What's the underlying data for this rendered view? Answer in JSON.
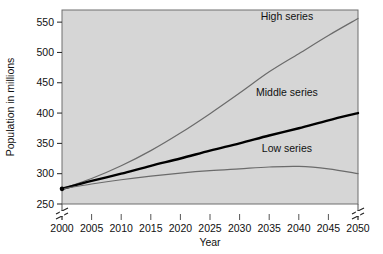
{
  "chart_data": {
    "type": "line",
    "title": "",
    "xlabel": "Year",
    "ylabel": "Population in millions",
    "xlim": [
      2000,
      2050
    ],
    "ylim": [
      250,
      570
    ],
    "xticks": [
      2000,
      2005,
      2010,
      2015,
      2020,
      2025,
      2030,
      2035,
      2040,
      2045,
      2050
    ],
    "yticks": [
      250,
      300,
      350,
      400,
      450,
      500,
      550
    ],
    "xtick_labels": [
      "2000",
      "2005",
      "2010",
      "2015",
      "2020",
      "2025",
      "2030",
      "2035",
      "2040",
      "2045",
      "2050"
    ],
    "ytick_labels": [
      "250",
      "300",
      "350",
      "400",
      "450",
      "500",
      "550"
    ],
    "grid": false,
    "legend": "inline-annotations",
    "axis_break": {
      "present": true,
      "position": "below-lowest-ytick",
      "sides": [
        "left",
        "right"
      ]
    },
    "plot_background_color": "#d6d6d6",
    "plot_border_color": "#6e6e6e",
    "x": [
      2000,
      2005,
      2010,
      2015,
      2020,
      2025,
      2030,
      2035,
      2040,
      2045,
      2050
    ],
    "series": [
      {
        "name": "High series",
        "label": "High series",
        "color": "#6b6b6b",
        "line_width": 1.2,
        "values": [
          275,
          292,
          313,
          338,
          367,
          399,
          433,
          468,
          498,
          528,
          556
        ]
      },
      {
        "name": "Middle series",
        "label": "Middle series",
        "color": "#000000",
        "line_width": 2.4,
        "values": [
          275,
          288,
          300,
          313,
          325,
          338,
          350,
          363,
          375,
          388,
          400
        ]
      },
      {
        "name": "Low series",
        "label": "Low series",
        "color": "#6b6b6b",
        "line_width": 1.2,
        "values": [
          275,
          283,
          290,
          296,
          301,
          305,
          308,
          311,
          312,
          308,
          300
        ]
      }
    ],
    "start_marker": {
      "x": 2000,
      "y": 275,
      "color": "#000000"
    },
    "annotations": [
      {
        "text": "High series",
        "x": 2038,
        "y": 553
      },
      {
        "text": "Middle series",
        "x": 2038,
        "y": 428
      },
      {
        "text": "Low series",
        "x": 2038,
        "y": 335
      }
    ]
  }
}
